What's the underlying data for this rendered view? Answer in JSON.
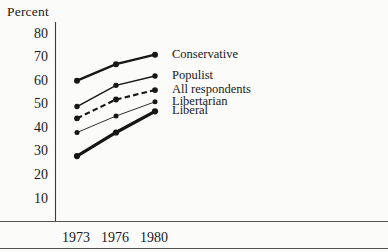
{
  "page": {
    "background": "#fbfbf9",
    "ink": "#1a1a1a",
    "rule_color": "#55524e"
  },
  "chart_data": {
    "type": "line",
    "title": "",
    "ylabel": "Percent",
    "xlabel": "",
    "x_categories": [
      "1973",
      "1976",
      "1980"
    ],
    "y_ticks": [
      80,
      70,
      60,
      50,
      40,
      30,
      20,
      10
    ],
    "ylim": [
      10,
      80
    ],
    "grid": false,
    "legend_position": "right-of-line-ends",
    "series": [
      {
        "name": "Conservative",
        "values": [
          60,
          67,
          71
        ],
        "style": "solid-bold",
        "color": "#161616"
      },
      {
        "name": "Populist",
        "values": [
          49,
          58,
          62
        ],
        "style": "solid-medium",
        "color": "#161616"
      },
      {
        "name": "All respondents",
        "values": [
          44,
          52,
          56
        ],
        "style": "dashed-bold",
        "color": "#161616"
      },
      {
        "name": "Libertarian",
        "values": [
          38,
          45,
          51
        ],
        "style": "solid-thin",
        "color": "#161616"
      },
      {
        "name": "Liberal",
        "values": [
          28,
          38,
          47
        ],
        "style": "solid-heavy",
        "color": "#161616"
      }
    ]
  }
}
